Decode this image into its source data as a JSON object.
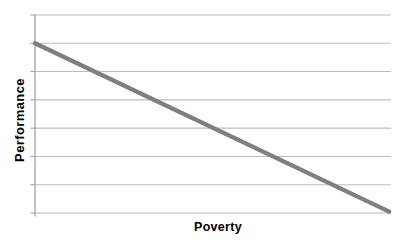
{
  "chart_data": {
    "type": "line",
    "title": "",
    "xlabel": "Poverty",
    "ylabel": "Performance",
    "xlim": [
      0,
      1
    ],
    "ylim": [
      0,
      7
    ],
    "y_gridlines": 8,
    "x_tick_labels": [],
    "y_tick_labels": [],
    "legend": "none",
    "grid": "horizontal-only",
    "series": [
      {
        "name": "Performance vs Poverty trend",
        "points": [
          {
            "x": 0.0,
            "y": 6.0
          },
          {
            "x": 0.995,
            "y": 0.05
          }
        ]
      }
    ],
    "colors": {
      "series_line": "#7f7f7f",
      "gridline": "#bdbdbd",
      "axis": "#a3a3a3",
      "label_text": "#000000",
      "background": "#ffffff"
    }
  }
}
